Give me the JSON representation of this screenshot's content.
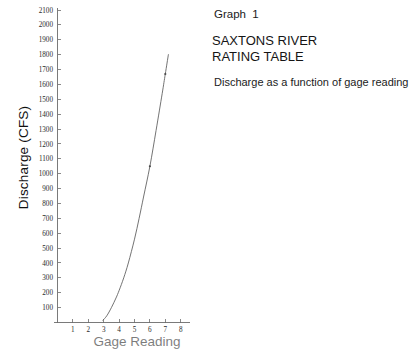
{
  "caption": {
    "graph_number": "Graph  1",
    "title_line1": "SAXTONS RIVER",
    "title_line2": "RATING TABLE",
    "subtitle": "Discharge as a function of gage reading"
  },
  "axes": {
    "y_title": "Discharge (CFS)",
    "x_title": "Gage Reading",
    "y_ticks": [
      100,
      200,
      300,
      400,
      500,
      600,
      700,
      800,
      900,
      1000,
      1100,
      1200,
      1300,
      1400,
      1500,
      1600,
      1700,
      1800,
      1900,
      2000,
      2100
    ],
    "x_ticks": [
      1,
      2,
      3,
      4,
      5,
      6,
      7,
      8
    ]
  },
  "chart_data": {
    "type": "line",
    "title": "SAXTONS RIVER RATING TABLE",
    "subtitle": "Discharge as a function of gage reading",
    "xlabel": "Gage Reading",
    "ylabel": "Discharge (CFS)",
    "xlim": [
      0,
      8.6
    ],
    "ylim": [
      0,
      2150
    ],
    "grid": false,
    "legend": "none",
    "x": [
      2.95,
      3.2,
      3.5,
      3.8,
      4.0,
      4.3,
      4.6,
      5.0,
      5.3,
      5.6,
      6.0,
      6.4,
      6.8,
      7.0,
      7.2
    ],
    "y": [
      15,
      45,
      100,
      165,
      215,
      300,
      400,
      560,
      700,
      850,
      1050,
      1290,
      1540,
      1670,
      1800
    ],
    "series": [
      {
        "name": "Rating curve",
        "x": [
          2.95,
          3.2,
          3.5,
          3.8,
          4.0,
          4.3,
          4.6,
          5.0,
          5.3,
          5.6,
          6.0,
          6.4,
          6.8,
          7.0,
          7.2
        ],
        "values": [
          15,
          45,
          100,
          165,
          215,
          300,
          400,
          560,
          700,
          850,
          1050,
          1290,
          1540,
          1670,
          1800
        ]
      }
    ],
    "markers": [
      {
        "x": 6.0,
        "y": 1050
      },
      {
        "x": 7.0,
        "y": 1670
      }
    ],
    "x_tick_labels": [
      "1",
      "2",
      "3",
      "4",
      "5",
      "6",
      "7",
      "8"
    ],
    "y_tick_labels": [
      "100",
      "200",
      "300",
      "400",
      "500",
      "600",
      "700",
      "800",
      "900",
      "1000",
      "1100",
      "1200",
      "1300",
      "1400",
      "1500",
      "1600",
      "1700",
      "1800",
      "1900",
      "2000",
      "2100"
    ]
  },
  "colors": {
    "curve": "#5a5a5a",
    "axis": "#6b6b6b",
    "text": "#1a1a1a",
    "background": "#ffffff"
  }
}
